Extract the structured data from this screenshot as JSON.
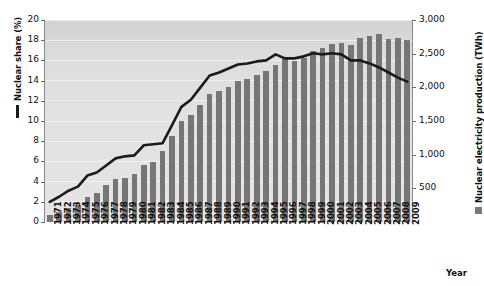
{
  "chart_data": {
    "type": "bar",
    "title": "",
    "xlabel": "Year",
    "grid": true,
    "categories": [
      "1971",
      "1972",
      "1973",
      "1974",
      "1975",
      "1976",
      "1977",
      "1978",
      "1979",
      "1980",
      "1981",
      "1982",
      "1983",
      "1984",
      "1985",
      "1986",
      "1987",
      "1988",
      "1989",
      "1990",
      "1991",
      "1992",
      "1993",
      "1994",
      "1995",
      "1996",
      "1997",
      "1998",
      "1999",
      "2000",
      "2001",
      "2002",
      "2003",
      "2004",
      "2005",
      "2006",
      "2007",
      "2008",
      "2009"
    ],
    "series": [
      {
        "name": "Nuclear electricity production (TWh)",
        "type": "bar",
        "axis": "right",
        "color": "#767676",
        "unit": "TWh",
        "values": [
          111,
          150,
          203,
          253,
          367,
          436,
          544,
          634,
          660,
          714,
          846,
          897,
          1050,
          1271,
          1493,
          1590,
          1742,
          1899,
          1945,
          2000,
          2097,
          2119,
          2187,
          2240,
          2332,
          2416,
          2391,
          2439,
          2537,
          2586,
          2640,
          2661,
          2635,
          2738,
          2768,
          2793,
          2719,
          2731,
          2697
        ]
      },
      {
        "name": "Nuclear share (%)",
        "type": "line",
        "axis": "left",
        "color": "#1b1b1b",
        "unit": "%",
        "values": [
          2.0,
          2.5,
          3.1,
          3.5,
          4.6,
          4.9,
          5.6,
          6.3,
          6.5,
          6.6,
          7.6,
          7.7,
          7.8,
          9.6,
          11.4,
          12.1,
          13.3,
          14.5,
          14.8,
          15.2,
          15.6,
          15.7,
          15.9,
          16.0,
          16.6,
          16.2,
          16.2,
          16.4,
          16.7,
          16.6,
          16.7,
          16.6,
          16.0,
          16.0,
          15.7,
          15.3,
          14.8,
          14.3,
          13.9
        ]
      }
    ],
    "left_axis": {
      "label": "Nuclear share (%)",
      "ticks": [
        0,
        2,
        4,
        6,
        8,
        10,
        12,
        14,
        16,
        18,
        20
      ],
      "ylim": [
        0,
        20
      ]
    },
    "right_axis": {
      "label": "Nuclear electricity production (TWh)",
      "ticks": [
        "0",
        "500",
        "1,000",
        "1,500",
        "2,000",
        "2,500",
        "3,000"
      ],
      "tick_values": [
        0,
        500,
        1000,
        1500,
        2000,
        2500,
        3000
      ],
      "ylim": [
        0,
        3000
      ]
    },
    "legend": {
      "line_entry": "Nuclear share (%)",
      "bar_entry": "Nuclear electricity production (TWh)",
      "position": "axis-titles"
    }
  }
}
